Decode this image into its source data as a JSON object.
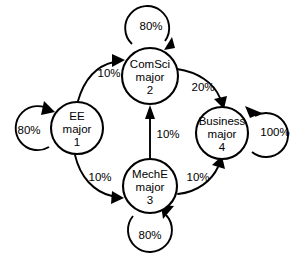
{
  "diagram": {
    "type": "state-transition-diagram",
    "title": "",
    "background_color": "#ffffff",
    "stroke_color": "#000000",
    "nodes": [
      {
        "id": "ee",
        "name": "EE",
        "line1": "EE",
        "line2": "major",
        "line3": "1",
        "cx": 77,
        "cy": 128,
        "r": 26
      },
      {
        "id": "comsci",
        "name": "ComSci",
        "line1": "ComSci",
        "line2": "major",
        "line3": "2",
        "cx": 150,
        "cy": 76,
        "r": 28
      },
      {
        "id": "meche",
        "name": "MechE",
        "line1": "MechE",
        "line2": "major",
        "line3": "3",
        "cx": 150,
        "cy": 186,
        "r": 27
      },
      {
        "id": "business",
        "name": "Business",
        "line1": "Business",
        "line2": "major",
        "line3": "4",
        "cx": 222,
        "cy": 133,
        "r": 26
      }
    ],
    "edges": [
      {
        "id": "ee-comsci",
        "from": "EE",
        "to": "ComSci",
        "label": "10%",
        "label_x": 109,
        "label_y": 74
      },
      {
        "id": "ee-meche",
        "from": "EE",
        "to": "MechE",
        "label": "10%",
        "label_x": 100,
        "label_y": 178
      },
      {
        "id": "comsci-business",
        "from": "ComSci",
        "to": "Business",
        "label": "20%",
        "label_x": 203,
        "label_y": 88
      },
      {
        "id": "meche-comsci",
        "from": "MechE",
        "to": "ComSci",
        "label": "10%",
        "label_x": 168,
        "label_y": 135
      },
      {
        "id": "meche-business",
        "from": "MechE",
        "to": "Business",
        "label": "10%",
        "label_x": 198,
        "label_y": 178
      }
    ],
    "self_loops": [
      {
        "id": "ee-self",
        "node": "EE",
        "label": "80%",
        "label_x": 29,
        "label_y": 131
      },
      {
        "id": "comsci-self",
        "node": "ComSci",
        "label": "80%",
        "label_x": 151,
        "label_y": 27
      },
      {
        "id": "meche-self",
        "node": "MechE",
        "label": "80%",
        "label_x": 150,
        "label_y": 236
      },
      {
        "id": "business-self",
        "node": "Business",
        "label": "100%",
        "label_x": 275,
        "label_y": 133
      }
    ]
  }
}
